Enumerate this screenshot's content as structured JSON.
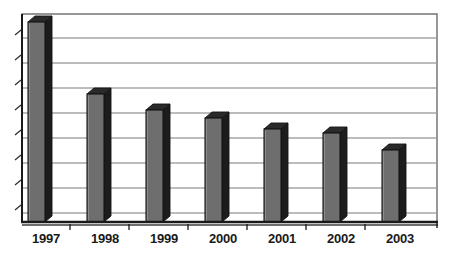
{
  "chart_data": {
    "type": "bar",
    "title": "",
    "subtitle": "",
    "xlabel": "",
    "ylabel": "",
    "categories": [
      "1997",
      "1998",
      "1999",
      "2000",
      "2001",
      "2002",
      "2003"
    ],
    "values": [
      100.0,
      64.5,
      56.0,
      51.5,
      46.0,
      43.0,
      35.5
    ],
    "series": [
      {
        "name": "",
        "values": [
          100.0,
          64.5,
          56.0,
          51.5,
          46.0,
          43.0,
          35.5
        ]
      }
    ],
    "ylim": [
      0,
      105
    ],
    "ytick_labels": [],
    "ytick_count": 9,
    "grid": true,
    "gridlines_horizontal": 8,
    "gridlines_vertical": 0,
    "legend": false,
    "legend_position": "none",
    "annotations": [],
    "style": "3d-column",
    "colors": {
      "bar_face": "#6e6e6e",
      "bar_side": "#1c1c1c",
      "bar_top": "#2a2a2a",
      "bar_outline": "#141414",
      "gridline": "#7a7a7a",
      "frame": "#5a5a5a",
      "axis": "#1a1a1a",
      "label_text": "#1a1a1a",
      "background": "#ffffff"
    }
  },
  "chart": {
    "plot": {
      "left": 22,
      "right": 437,
      "top": 14,
      "bottom": 222
    },
    "bars": [
      {
        "label": "1997",
        "value": 100.0,
        "x": 28,
        "top": 22,
        "width": 17
      },
      {
        "label": "1998",
        "value": 64.5,
        "x": 87,
        "top": 94,
        "width": 17
      },
      {
        "label": "1999",
        "value": 56.0,
        "x": 146,
        "top": 110,
        "width": 17
      },
      {
        "label": "2000",
        "value": 51.5,
        "x": 205,
        "top": 118,
        "width": 17
      },
      {
        "label": "2001",
        "value": 46.0,
        "x": 264,
        "top": 129,
        "width": 17
      },
      {
        "label": "2002",
        "value": 43.0,
        "x": 323,
        "top": 133,
        "width": 17
      },
      {
        "label": "2003",
        "value": 35.5,
        "x": 382,
        "top": 150,
        "width": 17
      }
    ],
    "gridline_y": [
      38,
      63,
      88,
      113,
      138,
      163,
      188,
      213
    ],
    "ytick_y": [
      32,
      57,
      82,
      107,
      132,
      157,
      182,
      207
    ],
    "xtick_x": [
      70,
      129,
      188,
      247,
      306,
      365
    ],
    "label_y": 243,
    "label_x": [
      46,
      105,
      164,
      223,
      282,
      341,
      400
    ]
  }
}
